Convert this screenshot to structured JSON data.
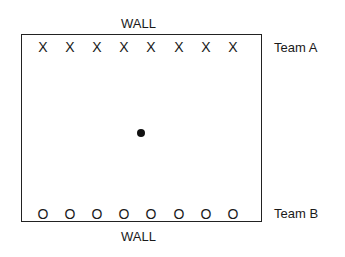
{
  "diagram": {
    "top_wall_label": "WALL",
    "bottom_wall_label": "WALL",
    "team_a": {
      "label": "Team A",
      "marker": "X",
      "count": 8,
      "players": [
        "X",
        "X",
        "X",
        "X",
        "X",
        "X",
        "X",
        "X"
      ]
    },
    "team_b": {
      "label": "Team B",
      "marker": "O",
      "count": 8,
      "players": [
        "O",
        "O",
        "O",
        "O",
        "O",
        "O",
        "O",
        "O"
      ]
    },
    "ball": {
      "shape": "filled-circle",
      "position": "center"
    },
    "colors": {
      "line": "#222222",
      "text": "#1a1a1a",
      "background": "#ffffff"
    }
  }
}
